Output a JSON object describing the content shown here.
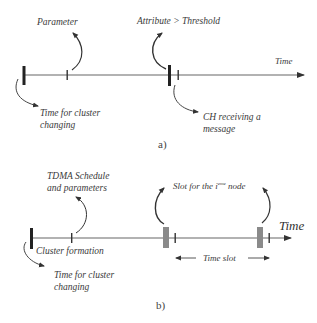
{
  "diagram_a": {
    "caption": "a)",
    "axis_label": "Time",
    "annotations": {
      "parameter": "Parameter",
      "attribute_threshold": "Attribute > Threshold",
      "cluster_change_line1": "Time for cluster",
      "cluster_change_line2": "changing",
      "ch_receiving_line1": "CH receiving a",
      "ch_receiving_line2": "message"
    }
  },
  "diagram_b": {
    "caption": "b)",
    "axis_label": "Time",
    "annotations": {
      "tdma_line1": "TDMA Schedule",
      "tdma_line2": "and parameters",
      "slot_prefix": "Slot for the i",
      "slot_sup": "eme",
      "slot_suffix": " node",
      "cluster_formation": "Cluster formation",
      "cluster_change_line1": "Time for cluster",
      "cluster_change_line2": "changing",
      "time_slot": "Time slot"
    }
  },
  "colors": {
    "line": "#555555",
    "tick": "#2a2a2a",
    "slot": "#8a8a8a"
  }
}
